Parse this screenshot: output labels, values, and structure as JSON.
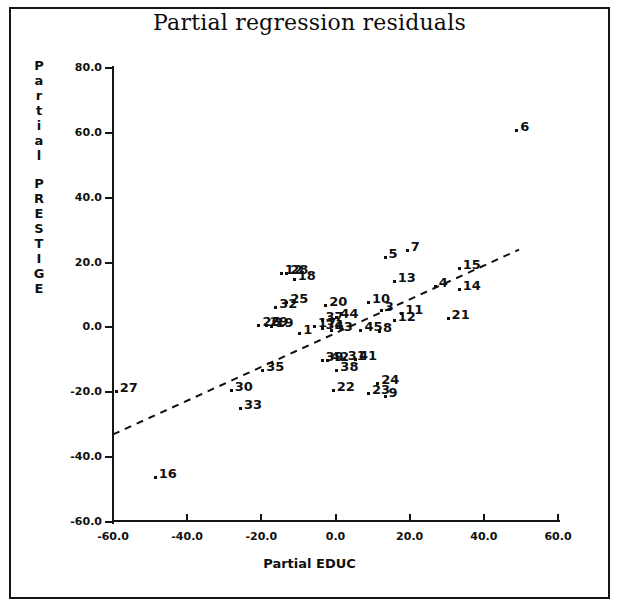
{
  "chart_data": {
    "type": "scatter",
    "title": "Partial regression residuals",
    "xlabel": "Partial EDUC",
    "ylabel": "Partial PRESTIGE",
    "xlim": [
      -60.0,
      60.0
    ],
    "ylim": [
      -60.0,
      80.0
    ],
    "xticks": [
      "-60.0",
      "-40.0",
      "-20.0",
      "0.0",
      "20.0",
      "40.0",
      "60.0"
    ],
    "yticks": [
      "80.0",
      "60.0",
      "40.0",
      "20.0",
      "0.0",
      "-20.0",
      "-40.0",
      "-60.0"
    ],
    "grid": false,
    "legend": "none",
    "marker": "small-filled-square",
    "fit_line": {
      "style": "dashed",
      "x_start": -60.0,
      "y_start": -33.0,
      "x_end": 49.5,
      "y_end": 24.0
    },
    "points": [
      {
        "label": "6",
        "x": 49.0,
        "y": 60.5
      },
      {
        "label": "5",
        "x": 13.5,
        "y": 21.5
      },
      {
        "label": "7",
        "x": 19.5,
        "y": 23.5
      },
      {
        "label": "15",
        "x": 33.5,
        "y": 18.0
      },
      {
        "label": "12",
        "x": -14.5,
        "y": 16.5
      },
      {
        "label": "28",
        "x": -13.0,
        "y": 16.5
      },
      {
        "label": "18",
        "x": -11.0,
        "y": 14.5
      },
      {
        "label": "13",
        "x": 16.0,
        "y": 14.0
      },
      {
        "label": "4",
        "x": 27.0,
        "y": 12.5
      },
      {
        "label": "14",
        "x": 33.5,
        "y": 11.5
      },
      {
        "label": "25",
        "x": -13.0,
        "y": 7.5
      },
      {
        "label": "32",
        "x": -16.0,
        "y": 6.0
      },
      {
        "label": "20",
        "x": -2.5,
        "y": 6.5
      },
      {
        "label": "10",
        "x": 9.0,
        "y": 7.5
      },
      {
        "label": "3",
        "x": 12.5,
        "y": 5.0
      },
      {
        "label": "11",
        "x": 18.0,
        "y": 4.0
      },
      {
        "label": "21",
        "x": 30.5,
        "y": 2.5
      },
      {
        "label": "12b",
        "x": 16.0,
        "y": 2.0
      },
      {
        "label": "26",
        "x": -20.5,
        "y": 0.5
      },
      {
        "label": "29",
        "x": -18.5,
        "y": 0.5
      },
      {
        "label": "19",
        "x": -17.0,
        "y": 0.0
      },
      {
        "label": "37",
        "x": -3.5,
        "y": 2.0
      },
      {
        "label": "44",
        "x": 0.5,
        "y": 3.0
      },
      {
        "label": "17",
        "x": -5.5,
        "y": 0.0
      },
      {
        "label": "34",
        "x": -3.5,
        "y": -0.5
      },
      {
        "label": "43",
        "x": -1.0,
        "y": -1.0
      },
      {
        "label": "45",
        "x": 7.0,
        "y": -1.0
      },
      {
        "label": "8",
        "x": 12.0,
        "y": -1.5
      },
      {
        "label": "1",
        "x": -9.5,
        "y": -2.0
      },
      {
        "label": "35",
        "x": -19.5,
        "y": -13.5
      },
      {
        "label": "39",
        "x": -3.5,
        "y": -10.5
      },
      {
        "label": "42",
        "x": -2.0,
        "y": -10.5
      },
      {
        "label": "31",
        "x": 2.5,
        "y": -10.0
      },
      {
        "label": "41",
        "x": 5.5,
        "y": -10.0
      },
      {
        "label": "38",
        "x": 0.5,
        "y": -13.5
      },
      {
        "label": "30",
        "x": -28.0,
        "y": -19.5
      },
      {
        "label": "22",
        "x": -0.5,
        "y": -19.5
      },
      {
        "label": "23",
        "x": 9.0,
        "y": -20.5
      },
      {
        "label": "24",
        "x": 11.5,
        "y": -17.5
      },
      {
        "label": "9",
        "x": 13.5,
        "y": -21.5
      },
      {
        "label": "33",
        "x": -25.5,
        "y": -25.0
      },
      {
        "label": "27",
        "x": -59.0,
        "y": -20.0
      },
      {
        "label": "16",
        "x": -48.5,
        "y": -46.5
      }
    ]
  }
}
